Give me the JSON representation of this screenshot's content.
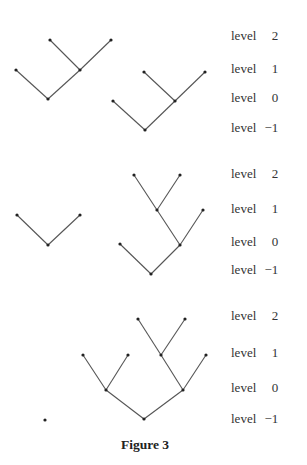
{
  "caption": "Figure 3",
  "panels": [
    {
      "labels": [
        {
          "word": "level",
          "value": "2",
          "y": 37
        },
        {
          "word": "level",
          "value": "1",
          "y": 70
        },
        {
          "word": "level",
          "value": "0",
          "y": 99
        },
        {
          "word": "level",
          "value": "−1",
          "y": 129
        }
      ],
      "trees": [
        {
          "nodes": [
            [
              16,
              70
            ],
            [
              48,
              99
            ],
            [
              80,
              70
            ],
            [
              50,
              40
            ],
            [
              111,
              40
            ]
          ],
          "edges": [
            [
              0,
              1
            ],
            [
              1,
              2
            ],
            [
              2,
              3
            ],
            [
              2,
              4
            ]
          ]
        },
        {
          "nodes": [
            [
              113,
              101
            ],
            [
              145,
              130
            ],
            [
              175,
              101
            ],
            [
              144,
              72
            ],
            [
              205,
              72
            ]
          ],
          "edges": [
            [
              0,
              1
            ],
            [
              1,
              2
            ],
            [
              2,
              3
            ],
            [
              2,
              4
            ]
          ]
        }
      ]
    },
    {
      "labels": [
        {
          "word": "level",
          "value": "2",
          "y": 175
        },
        {
          "word": "level",
          "value": "1",
          "y": 210
        },
        {
          "word": "level",
          "value": "0",
          "y": 243
        },
        {
          "word": "level",
          "value": "−1",
          "y": 271
        }
      ],
      "trees": [
        {
          "nodes": [
            [
              17,
              215
            ],
            [
              48,
              245
            ],
            [
              80,
              215
            ]
          ],
          "edges": [
            [
              0,
              1
            ],
            [
              1,
              2
            ]
          ]
        },
        {
          "nodes": [
            [
              120,
              244
            ],
            [
              151,
              274
            ],
            [
              180,
              245
            ],
            [
              157,
              210
            ],
            [
              203,
              210
            ],
            [
              134,
              175
            ],
            [
              180,
              175
            ]
          ],
          "edges": [
            [
              0,
              1
            ],
            [
              1,
              2
            ],
            [
              2,
              3
            ],
            [
              2,
              4
            ],
            [
              3,
              5
            ],
            [
              3,
              6
            ]
          ]
        }
      ]
    },
    {
      "labels": [
        {
          "word": "level",
          "value": "2",
          "y": 317
        },
        {
          "word": "level",
          "value": "1",
          "y": 354
        },
        {
          "word": "level",
          "value": "0",
          "y": 389
        },
        {
          "word": "level",
          "value": "−1",
          "y": 420
        }
      ],
      "trees": [
        {
          "nodes": [
            [
              45,
              420
            ]
          ],
          "edges": []
        },
        {
          "nodes": [
            [
              144,
              419
            ],
            [
              106,
              390
            ],
            [
              183,
              390
            ],
            [
              83,
              355
            ],
            [
              128,
              355
            ],
            [
              161,
              355
            ],
            [
              206,
              355
            ],
            [
              138,
              319
            ],
            [
              185,
              319
            ]
          ],
          "edges": [
            [
              0,
              1
            ],
            [
              0,
              2
            ],
            [
              1,
              3
            ],
            [
              1,
              4
            ],
            [
              2,
              5
            ],
            [
              2,
              6
            ],
            [
              5,
              7
            ],
            [
              5,
              8
            ]
          ]
        }
      ]
    }
  ]
}
